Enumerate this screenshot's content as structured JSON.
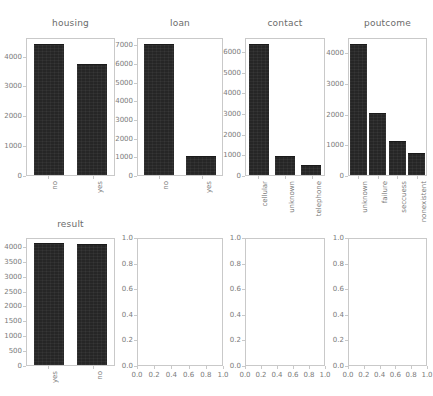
{
  "figure": {
    "width": 433,
    "height": 396,
    "background": "#ffffff",
    "bar_color": "#262626",
    "axis_color": "#c9c9c9",
    "text_color": "#7a7a7a",
    "title_color": "#6b6b6b"
  },
  "chart_data": [
    {
      "type": "bar",
      "title": "housing",
      "categories": [
        "no",
        "yes"
      ],
      "values": [
        4400,
        3720
      ],
      "yticks": [
        0,
        1000,
        2000,
        3000,
        4000
      ],
      "ytick_labels": [
        "0",
        "1000",
        "2000",
        "3000",
        "4000"
      ],
      "ylim": [
        0,
        4620
      ],
      "xlabel": "",
      "ylabel": "",
      "grid": false,
      "legend": false
    },
    {
      "type": "bar",
      "title": "loan",
      "categories": [
        "no",
        "yes"
      ],
      "values": [
        7050,
        1000
      ],
      "yticks": [
        0,
        1000,
        2000,
        3000,
        4000,
        5000,
        6000,
        7000
      ],
      "ytick_labels": [
        "0",
        "1000",
        "2000",
        "3000",
        "4000",
        "5000",
        "6000",
        "7000"
      ],
      "ylim": [
        0,
        7400
      ],
      "xlabel": "",
      "ylabel": "",
      "grid": false,
      "legend": false
    },
    {
      "type": "bar",
      "title": "contact",
      "categories": [
        "cellular",
        "unknown",
        "telephone"
      ],
      "values": [
        6350,
        900,
        500
      ],
      "yticks": [
        0,
        1000,
        2000,
        3000,
        4000,
        5000,
        6000
      ],
      "ytick_labels": [
        "0",
        "1000",
        "2000",
        "3000",
        "4000",
        "5000",
        "6000"
      ],
      "ylim": [
        0,
        6670
      ],
      "xlabel": "",
      "ylabel": "",
      "grid": false,
      "legend": false
    },
    {
      "type": "bar",
      "title": "poutcome",
      "categories": [
        "unknown",
        "failure",
        "seccuess",
        "nonexistent"
      ],
      "values": [
        4280,
        2030,
        1120,
        730
      ],
      "yticks": [
        0,
        1000,
        2000,
        3000,
        4000
      ],
      "ytick_labels": [
        "0",
        "1000",
        "2000",
        "3000",
        "4000"
      ],
      "ylim": [
        0,
        4500
      ],
      "xlabel": "",
      "ylabel": "",
      "grid": false,
      "legend": false
    },
    {
      "type": "bar",
      "title": "result",
      "categories": [
        "yes",
        "no"
      ],
      "values": [
        4100,
        4050
      ],
      "yticks": [
        0,
        500,
        1000,
        1500,
        2000,
        2500,
        3000,
        3500,
        4000
      ],
      "ytick_labels": [
        "0",
        "500",
        "1000",
        "1500",
        "2000",
        "2500",
        "3000",
        "3500",
        "4000"
      ],
      "ylim": [
        0,
        4300
      ],
      "xlabel": "",
      "ylabel": "",
      "grid": false,
      "legend": false
    },
    {
      "type": "empty",
      "title": "",
      "categories": [],
      "values": [],
      "yticks": [
        0.0,
        0.2,
        0.4,
        0.6,
        0.8,
        1.0
      ],
      "ytick_labels": [
        "0.0",
        "0.2",
        "0.4",
        "0.6",
        "0.8",
        "1.0"
      ],
      "xticks": [
        0.0,
        0.2,
        0.4,
        0.6,
        0.8,
        1.0
      ],
      "xtick_labels": [
        "0.0",
        "0.2",
        "0.4",
        "0.6",
        "0.8",
        "1.0"
      ],
      "ylim": [
        0,
        1
      ],
      "xlim": [
        0,
        1
      ],
      "grid": false,
      "legend": false
    },
    {
      "type": "empty",
      "title": "",
      "categories": [],
      "values": [],
      "yticks": [
        0.0,
        0.2,
        0.4,
        0.6,
        0.8,
        1.0
      ],
      "ytick_labels": [
        "0.0",
        "0.2",
        "0.4",
        "0.6",
        "0.8",
        "1.0"
      ],
      "xticks": [
        0.0,
        0.2,
        0.4,
        0.6,
        0.8,
        1.0
      ],
      "xtick_labels": [
        "0.0",
        "0.2",
        "0.4",
        "0.6",
        "0.8",
        "1.0"
      ],
      "ylim": [
        0,
        1
      ],
      "xlim": [
        0,
        1
      ],
      "grid": false,
      "legend": false
    },
    {
      "type": "empty",
      "title": "",
      "categories": [],
      "values": [],
      "yticks": [
        0.0,
        0.2,
        0.4,
        0.6,
        0.8,
        1.0
      ],
      "ytick_labels": [
        "0.0",
        "0.2",
        "0.4",
        "0.6",
        "0.8",
        "1.0"
      ],
      "xticks": [
        0.0,
        0.2,
        0.4,
        0.6,
        0.8,
        1.0
      ],
      "xtick_labels": [
        "0.0",
        "0.2",
        "0.4",
        "0.6",
        "0.8",
        "1.0"
      ],
      "ylim": [
        0,
        1
      ],
      "xlim": [
        0,
        1
      ],
      "grid": false,
      "legend": false
    }
  ]
}
